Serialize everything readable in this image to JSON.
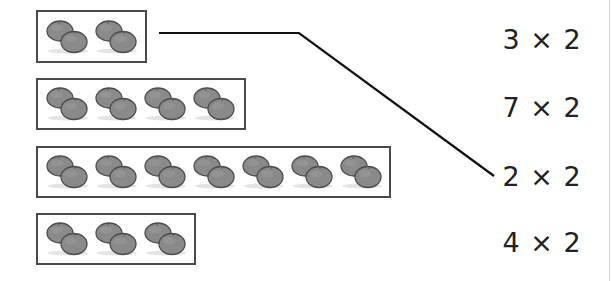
{
  "worksheet": {
    "groups": [
      {
        "id": "group-1",
        "pairs": 2,
        "box": {
          "left": 36,
          "top": 10,
          "width": 111,
          "height": 53
        }
      },
      {
        "id": "group-2",
        "pairs": 4,
        "box": {
          "left": 36,
          "top": 78,
          "width": 210,
          "height": 52
        }
      },
      {
        "id": "group-3",
        "pairs": 7,
        "box": {
          "left": 36,
          "top": 146,
          "width": 355,
          "height": 52
        }
      },
      {
        "id": "group-4",
        "pairs": 3,
        "box": {
          "left": 36,
          "top": 213,
          "width": 160,
          "height": 52
        }
      }
    ],
    "expressions": [
      {
        "label": "3 × 2",
        "top": 24
      },
      {
        "label": "7 × 2",
        "top": 92
      },
      {
        "label": "2 × 2",
        "top": 161
      },
      {
        "label": "4 × 2",
        "top": 227
      }
    ],
    "connector": {
      "from_group": "group-1",
      "to_expression": "2 × 2",
      "points": [
        [
          159,
          33
        ],
        [
          299,
          33
        ],
        [
          494,
          176
        ]
      ],
      "color": "#111111"
    },
    "fruit_icon": "orange-pair-icon",
    "colors": {
      "box_border": "#4a4a4a",
      "fruit_fill": "#8a8a8a",
      "fruit_outline": "#4d4d4d",
      "text": "#222222"
    }
  }
}
